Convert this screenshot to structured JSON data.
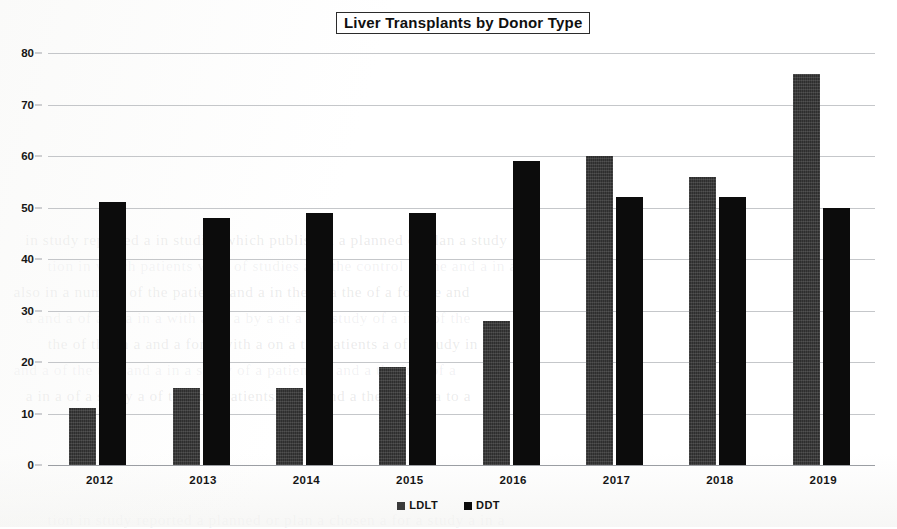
{
  "chart_data": {
    "type": "bar",
    "title": "Liver Transplants by Donor Type",
    "xlabel": "",
    "ylabel": "",
    "ylim": [
      0,
      80
    ],
    "ytick_step": 10,
    "yticks": [
      "0",
      "10",
      "20",
      "30",
      "40",
      "50",
      "60",
      "70",
      "80"
    ],
    "grid": true,
    "legend_position": "bottom",
    "categories": [
      "2012",
      "2013",
      "2014",
      "2015",
      "2016",
      "2017",
      "2018",
      "2019"
    ],
    "series": [
      {
        "name": "LDLT",
        "color": "#2e2e2e",
        "values": [
          11,
          15,
          15,
          19,
          28,
          60,
          56,
          76
        ]
      },
      {
        "name": "DDT",
        "color": "#0c0c0c",
        "values": [
          51,
          48,
          49,
          49,
          59,
          52,
          52,
          50
        ]
      }
    ]
  },
  "legend": {
    "items": [
      {
        "label": "LDLT",
        "swatch": "legend-swatch-ldlt"
      },
      {
        "label": "DDT",
        "swatch": "legend-swatch-ddt"
      }
    ]
  },
  "scan_artifacts": {
    "ghost_lines": [
      "in study reported a in studies which published a planned or plan a study",
      "tion in which patients were of studies a is the control of the and a in a",
      "also in a number of the patients and a in the in a the of a for the and",
      "a and a of a to a in a with a on a by a at a the study of a in a of the",
      "the of the in a and a for a with a on a the patients a of a study in a",
      "and a of the to a and a in a study of a patients a and a the in a of a",
      "a in a of a study a of the in a patients a of a and a the of a in a to a",
      "tion in study reported a planned or plan a chosen a for a study a in a"
    ]
  }
}
